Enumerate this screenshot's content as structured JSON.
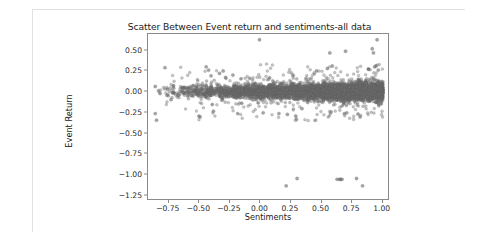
{
  "figure": {
    "title": "Scatter Between Event return and sentiments-all data",
    "background": "#ffffff",
    "border_color": "#e2e2e2"
  },
  "chart_data": {
    "type": "scatter",
    "title": "Scatter Between Event return and sentiments-all data",
    "xlabel": "Sentiments",
    "ylabel": "Event Return",
    "xlim": [
      -0.92,
      1.06
    ],
    "ylim": [
      -1.31,
      0.7
    ],
    "xticks": [
      -0.75,
      -0.5,
      -0.25,
      0.0,
      0.25,
      0.5,
      0.75,
      1.0
    ],
    "xtick_labels": [
      "−0.75",
      "−0.50",
      "−0.25",
      "0.00",
      "0.25",
      "0.50",
      "0.75",
      "1.00"
    ],
    "yticks": [
      0.5,
      0.25,
      0.0,
      -0.25,
      -0.5,
      -0.75,
      -1.0,
      -1.25
    ],
    "ytick_labels": [
      "0.50",
      "0.25",
      "0.00",
      "−0.25",
      "−0.50",
      "−0.75",
      "−1.00",
      "−1.25"
    ],
    "grid": false,
    "legend": null,
    "marker": {
      "color": "#6e6e6e",
      "edge_color": "#5a5a5a",
      "opacity": 0.55,
      "size_px": 3.2
    },
    "series": [
      {
        "name": "Event return vs sentiment",
        "description": "Dense horizontal band of points centred near Event Return 0.00, spanning Sentiments from about -0.90 to 1.02; density increases strongly toward Sentiments 0.75-1.00. A small group of low outliers sits near Event Return -1.05 to -1.15 between Sentiments 0.23 and 0.85.",
        "n_points_approx": 4200,
        "core_band": {
          "x_range": [
            -0.9,
            1.02
          ],
          "y_range": [
            -0.12,
            0.1
          ],
          "y_spread_left": 0.07,
          "y_spread_right": 0.13
        },
        "notable_points": [
          {
            "x": -0.86,
            "y": 0.06
          },
          {
            "x": -0.86,
            "y": -0.27
          },
          {
            "x": -0.85,
            "y": -0.35
          },
          {
            "x": -0.78,
            "y": 0.29
          },
          {
            "x": -0.73,
            "y": -0.1
          },
          {
            "x": -0.63,
            "y": 0.04
          },
          {
            "x": -0.55,
            "y": 0.07
          },
          {
            "x": -0.5,
            "y": -0.3
          },
          {
            "x": -0.49,
            "y": -0.31
          },
          {
            "x": -0.44,
            "y": 0.3
          },
          {
            "x": -0.42,
            "y": 0.26
          },
          {
            "x": -0.4,
            "y": 0.19
          },
          {
            "x": -0.38,
            "y": -0.24
          },
          {
            "x": -0.33,
            "y": 0.22
          },
          {
            "x": -0.3,
            "y": 0.25
          },
          {
            "x": -0.28,
            "y": 0.17
          },
          {
            "x": -0.22,
            "y": 0.2
          },
          {
            "x": -0.18,
            "y": -0.27
          },
          {
            "x": -0.08,
            "y": 0.16
          },
          {
            "x": 0.0,
            "y": 0.63
          },
          {
            "x": 0.03,
            "y": -0.26
          },
          {
            "x": 0.16,
            "y": -0.27
          },
          {
            "x": 0.22,
            "y": -1.15
          },
          {
            "x": 0.23,
            "y": -0.28
          },
          {
            "x": 0.31,
            "y": -1.06
          },
          {
            "x": 0.35,
            "y": -0.21
          },
          {
            "x": 0.47,
            "y": 0.25
          },
          {
            "x": 0.56,
            "y": 0.28
          },
          {
            "x": 0.58,
            "y": 0.47
          },
          {
            "x": 0.59,
            "y": -0.25
          },
          {
            "x": 0.6,
            "y": 0.31
          },
          {
            "x": 0.64,
            "y": -1.07
          },
          {
            "x": 0.66,
            "y": -1.07
          },
          {
            "x": 0.67,
            "y": -1.07
          },
          {
            "x": 0.68,
            "y": -1.07
          },
          {
            "x": 0.7,
            "y": -0.27
          },
          {
            "x": 0.71,
            "y": 0.49
          },
          {
            "x": 0.72,
            "y": -0.26
          },
          {
            "x": 0.8,
            "y": -1.06
          },
          {
            "x": 0.83,
            "y": -0.31
          },
          {
            "x": 0.85,
            "y": -1.15
          },
          {
            "x": 0.9,
            "y": 0.27
          },
          {
            "x": 0.93,
            "y": 0.52
          },
          {
            "x": 0.94,
            "y": 0.47
          },
          {
            "x": 0.95,
            "y": 0.3
          },
          {
            "x": 0.96,
            "y": 0.31
          },
          {
            "x": 0.97,
            "y": 0.63
          },
          {
            "x": 0.98,
            "y": 0.26
          }
        ]
      }
    ]
  }
}
